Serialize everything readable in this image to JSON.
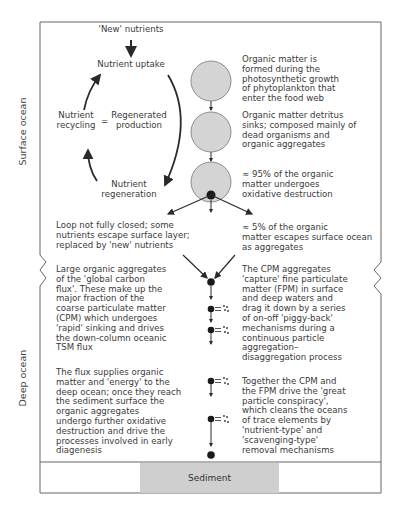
{
  "diagram": {
    "type": "ocean-particle-flux-schematic",
    "zones": {
      "surface": "Surface ocean",
      "deep": "Deep ocean",
      "bottom": "Sediment"
    },
    "nutrient_cycle": {
      "input": "'New' nutrients",
      "uptake": "Nutrient uptake",
      "recycling_line1": "Nutrient",
      "recycling_line2": "recycling",
      "equals": "=",
      "regenerated_line1": "Regenerated",
      "regenerated_line2": "production",
      "regeneration_line1": "Nutrient",
      "regeneration_line2": "regeneration"
    },
    "right_notes": [
      {
        "lines": [
          "Organic matter is",
          "formed during the",
          "photosynthetic growth",
          "of phytoplankton that",
          "enter the food web"
        ]
      },
      {
        "lines": [
          "Organic matter detritus",
          "sinks; composed mainly of",
          "dead organisms and",
          "organic aggregates"
        ]
      },
      {
        "lines": [
          "≈ 95% of the organic",
          "matter undergoes",
          "oxidative destruction"
        ]
      },
      {
        "lines": [
          "≈ 5% of the organic",
          "matter escapes surface ocean",
          "as aggregates"
        ]
      },
      {
        "lines": [
          "The CPM aggregates",
          "'capture' fine particulate",
          "matter (FPM) in surface",
          "and deep waters and",
          "drag it down by a series",
          "of on-off 'piggy-back'",
          "mechanisms during a",
          "continuous particle",
          "aggregation–",
          "disaggregation process"
        ]
      },
      {
        "lines": [
          "Together the CPM and",
          "the FPM drive the 'great",
          "particle conspiracy',",
          "which cleans the oceans",
          "of trace elements by",
          "'nutrient-type' and",
          "'scavenging-type'",
          "removal mechanisms"
        ]
      }
    ],
    "left_notes": [
      {
        "lines": [
          "Loop not fully closed; some",
          "nutrients escape surface layer;",
          "replaced by 'new' nutrients"
        ]
      },
      {
        "lines": [
          "Large organic aggregates",
          "of the 'global carbon",
          "flux'. These make up the",
          "major fraction of the",
          "coarse particulate matter",
          "(CPM) which undergoes",
          "'rapid' sinking and drives",
          "the down-column oceanic",
          "TSM flux"
        ]
      },
      {
        "lines": [
          "The flux supplies organic",
          "matter and 'energy' to the",
          "deep ocean; once they reach",
          "the sediment surface the",
          "organic aggregates",
          "undergo further oxidative",
          "destruction and drive the",
          "processes involved in early",
          "diagenesis"
        ]
      }
    ],
    "colors": {
      "frame": "#666666",
      "circle_fill": "#d4d4d4",
      "sediment_fill": "#cfcfcf",
      "arrow": "#2a2a2a",
      "text": "#3a3a3a"
    }
  }
}
